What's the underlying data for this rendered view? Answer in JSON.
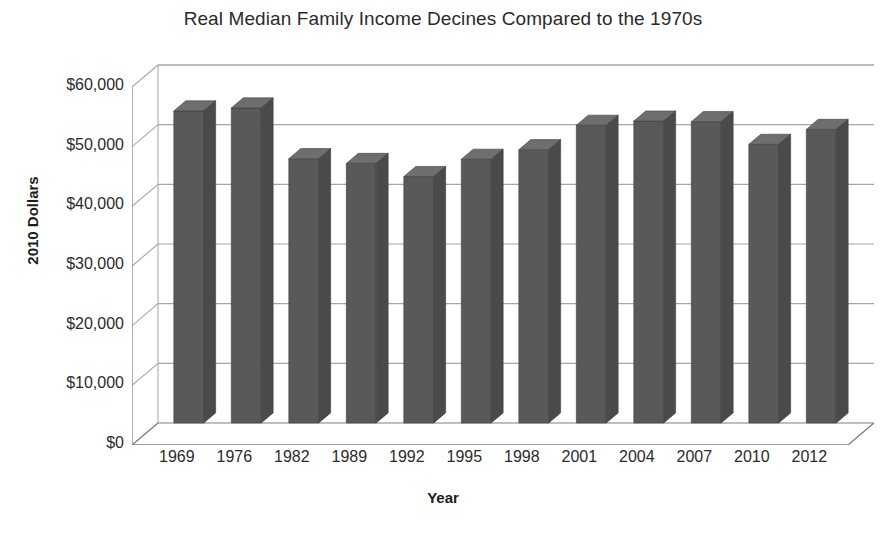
{
  "chart_data": {
    "type": "bar",
    "title": "Real Median Family Income Decines Compared to the 1970s",
    "xlabel": "Year",
    "ylabel": "2010 Dollars",
    "categories": [
      "1969",
      "1976",
      "1982",
      "1989",
      "1992",
      "1995",
      "1998",
      "2001",
      "2004",
      "2007",
      "2010",
      "2012"
    ],
    "values": [
      52300,
      52800,
      44300,
      43500,
      41300,
      44200,
      45800,
      49900,
      50600,
      50500,
      46700,
      49200
    ],
    "ylim": [
      0,
      60000
    ],
    "ytick_values": [
      0,
      10000,
      20000,
      30000,
      40000,
      50000,
      60000
    ],
    "ytick_labels": [
      "$0",
      "$10,000",
      "$20,000",
      "$30,000",
      "$40,000",
      "$50,000",
      "$60,000"
    ],
    "grid": true,
    "legend": "none",
    "style": "3d-column",
    "bar_color": "#595959",
    "bar_top_color": "#6e6e6e",
    "bar_side_color": "#4a4a4a",
    "gridline_color": "#a6a6a6",
    "axis_color": "#808080",
    "background_color": "#ffffff",
    "text_color": "#2b2b2b"
  },
  "artifact": {
    "bottom_strip_text": ""
  }
}
